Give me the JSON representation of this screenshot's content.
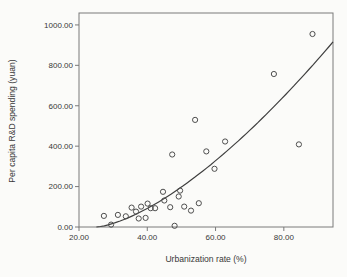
{
  "figure": {
    "background": "#fbfbf9",
    "frame_color": "#7a7a7a",
    "curve_color": "#3f3f3f",
    "point_color": "#4e4e4e",
    "text_color": "#383838"
  },
  "chart_data": {
    "type": "scatter",
    "title": "",
    "xlabel": "Urbanization rate (%)",
    "ylabel": "Per capita R&D spending (yuan)",
    "xlim": [
      20,
      94.4
    ],
    "ylim": [
      0,
      1059
    ],
    "x_ticks": [
      {
        "value": 20,
        "label": "20.00"
      },
      {
        "value": 40,
        "label": "40.00"
      },
      {
        "value": 60,
        "label": "60.00"
      },
      {
        "value": 80,
        "label": "80.00"
      }
    ],
    "y_ticks": [
      {
        "value": 0,
        "label": "0.00"
      },
      {
        "value": 200,
        "label": "200.00"
      },
      {
        "value": 400,
        "label": "400.00"
      },
      {
        "value": 600,
        "label": "600.00"
      },
      {
        "value": 800,
        "label": "800.00"
      },
      {
        "value": 1000,
        "label": "1000.00"
      }
    ],
    "grid": false,
    "legend": null,
    "points": [
      {
        "x": 27.3,
        "y": 55
      },
      {
        "x": 29.4,
        "y": 12
      },
      {
        "x": 31.4,
        "y": 60
      },
      {
        "x": 33.7,
        "y": 53
      },
      {
        "x": 35.4,
        "y": 96
      },
      {
        "x": 36.7,
        "y": 76
      },
      {
        "x": 37.5,
        "y": 42
      },
      {
        "x": 38.2,
        "y": 101
      },
      {
        "x": 39.5,
        "y": 45
      },
      {
        "x": 40.1,
        "y": 116
      },
      {
        "x": 41.0,
        "y": 93
      },
      {
        "x": 42.3,
        "y": 93
      },
      {
        "x": 44.6,
        "y": 174
      },
      {
        "x": 45.0,
        "y": 131
      },
      {
        "x": 46.7,
        "y": 98
      },
      {
        "x": 47.3,
        "y": 359
      },
      {
        "x": 48.0,
        "y": 6
      },
      {
        "x": 49.2,
        "y": 151
      },
      {
        "x": 49.6,
        "y": 180
      },
      {
        "x": 50.8,
        "y": 101
      },
      {
        "x": 52.8,
        "y": 81
      },
      {
        "x": 54.0,
        "y": 530
      },
      {
        "x": 55.1,
        "y": 118
      },
      {
        "x": 57.3,
        "y": 374
      },
      {
        "x": 59.7,
        "y": 288
      },
      {
        "x": 62.8,
        "y": 423
      },
      {
        "x": 77.1,
        "y": 757
      },
      {
        "x": 84.4,
        "y": 409
      },
      {
        "x": 88.4,
        "y": 955
      }
    ],
    "fit_curve": {
      "type": "power",
      "formula": "y = a * (x - x0)^b",
      "x0": 25,
      "a": 1.584,
      "b": 1.5,
      "x_start": 25.1,
      "x_end": 94.4
    }
  }
}
